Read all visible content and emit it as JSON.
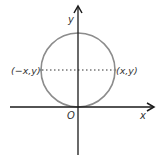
{
  "diagram": {
    "type": "coordinate-plane-circle",
    "colors": {
      "axes": "#1a1a1a",
      "circle": "#8c8c8c",
      "dotted_line": "#333333",
      "text": "#333333"
    },
    "axes": {
      "x_label": "x",
      "y_label": "y",
      "origin_label": "O"
    },
    "points": {
      "left": "(−x,y)",
      "right": "(x,y)"
    },
    "circle": {
      "description": "Circle tangent to x-axis at origin, symmetric about y-axis"
    },
    "segment": {
      "description": "Dotted horizontal line connecting (−x,y) and (x,y)"
    }
  }
}
